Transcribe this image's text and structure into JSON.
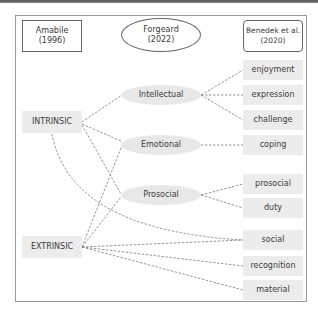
{
  "headers": {
    "amabile": {
      "line1": "Amabile",
      "line2": "(1996)"
    },
    "forgeard": {
      "line1": "Forgeard",
      "line2": "(2022)"
    },
    "benedek": {
      "line1": "Benedek et al.",
      "line2": "(2020)"
    }
  },
  "categories": {
    "intrinsic": "INTRINSIC",
    "extrinsic": "EXTRINSIC"
  },
  "forgeard_types": {
    "intellectual": "Intellectual",
    "emotional": "Emotional",
    "prosocial": "Prosocial"
  },
  "benedek_motives": {
    "enjoyment": "enjoyment",
    "expression": "expression",
    "challenge": "challenge",
    "coping": "coping",
    "prosocial": "prosocial",
    "duty": "duty",
    "social": "social",
    "recognition": "recognition",
    "material": "material"
  },
  "links": [
    {
      "from": "INTRINSIC",
      "to": "Intellectual"
    },
    {
      "from": "INTRINSIC",
      "to": "Emotional"
    },
    {
      "from": "INTRINSIC",
      "to": "Prosocial"
    },
    {
      "from": "INTRINSIC",
      "to": "social"
    },
    {
      "from": "EXTRINSIC",
      "to": "Emotional"
    },
    {
      "from": "EXTRINSIC",
      "to": "Prosocial"
    },
    {
      "from": "EXTRINSIC",
      "to": "social"
    },
    {
      "from": "EXTRINSIC",
      "to": "recognition"
    },
    {
      "from": "EXTRINSIC",
      "to": "material"
    },
    {
      "from": "Intellectual",
      "to": "enjoyment"
    },
    {
      "from": "Intellectual",
      "to": "expression"
    },
    {
      "from": "Intellectual",
      "to": "challenge"
    },
    {
      "from": "Emotional",
      "to": "coping"
    },
    {
      "from": "Prosocial",
      "to": "prosocial"
    },
    {
      "from": "Prosocial",
      "to": "duty"
    }
  ],
  "colors": {
    "node_fill": "#ececec",
    "line": "#777777",
    "border": "#666666"
  }
}
